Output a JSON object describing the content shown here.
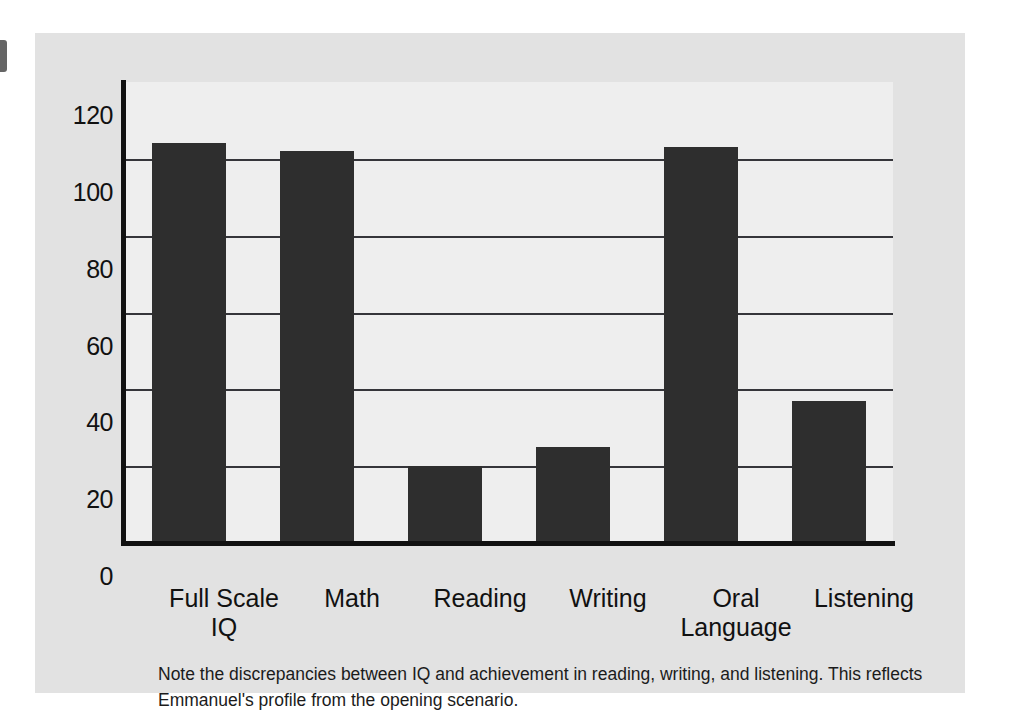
{
  "figure": {
    "caption": "Note the discrepancies between IQ and achievement in reading, writing, and listening. This reflects Emmanuel's profile from the opening scenario.",
    "panel_bg": "#e2e2e2",
    "plot_bg": "#eeeeee",
    "bar_color": "#2e2e2e",
    "axis_color": "#111111",
    "grid_color": "#35353a"
  },
  "chart_data": {
    "type": "bar",
    "title": "",
    "xlabel": "",
    "ylabel": "",
    "categories": [
      "Full Scale\nIQ",
      "Math",
      "Reading",
      "Writing",
      "Oral\nLanguage",
      "Listening"
    ],
    "values": [
      104,
      102,
      20,
      25,
      103,
      37
    ],
    "ylim": [
      0,
      120
    ],
    "yticks": [
      0,
      20,
      40,
      60,
      80,
      100,
      120
    ],
    "ytick_labels": [
      "0",
      "20",
      "40",
      "60",
      "80",
      "100",
      "120"
    ],
    "grid": true,
    "legend": false,
    "series": [
      {
        "name": "Score",
        "values": [
          104,
          102,
          20,
          25,
          103,
          37
        ]
      }
    ]
  }
}
